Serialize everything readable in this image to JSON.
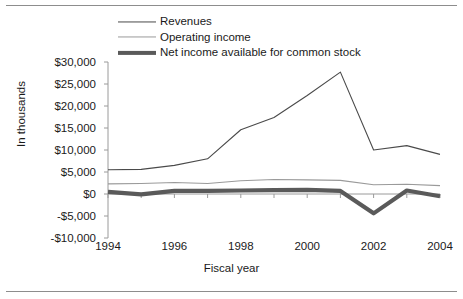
{
  "figure": {
    "border_color": "#8d8d8d",
    "background": "#ffffff"
  },
  "chart_data": {
    "type": "line",
    "title": "",
    "xlabel": "Fiscal year",
    "ylabel": "In thousands",
    "x": [
      1994,
      1995,
      1996,
      1997,
      1998,
      1999,
      2000,
      2001,
      2002,
      2003,
      2004
    ],
    "xlim": [
      1994,
      2004
    ],
    "ylim": [
      -10000,
      30000
    ],
    "xticks": [
      1994,
      1996,
      1998,
      2000,
      2002,
      2004
    ],
    "xtick_labels": [
      "1994",
      "1996",
      "1998",
      "2000",
      "2002",
      "2004"
    ],
    "yticks": [
      -10000,
      -5000,
      0,
      5000,
      10000,
      15000,
      20000,
      25000,
      30000
    ],
    "ytick_labels": [
      "-$10,000",
      "-$5,000",
      "$0",
      "$5,000",
      "$10,000",
      "$15,000",
      "$20,000",
      "$25,000",
      "$30,000"
    ],
    "grid": false,
    "legend_position": "top-center",
    "series": [
      {
        "name": "Revenues",
        "color": "#4a4a4a",
        "width": 1.1,
        "values": [
          5500,
          5600,
          6500,
          8000,
          14600,
          17400,
          22400,
          27700,
          10000,
          11000,
          9000
        ]
      },
      {
        "name": "Operating income",
        "color": "#9a9a9a",
        "width": 1.1,
        "values": [
          2300,
          2400,
          2600,
          2400,
          3000,
          3300,
          3200,
          3100,
          2100,
          2200,
          1900
        ]
      },
      {
        "name": "Net income available for common stock",
        "color": "#5a5a5a",
        "width": 4.2,
        "values": [
          500,
          -100,
          700,
          700,
          800,
          900,
          950,
          700,
          -4400,
          800,
          -500
        ]
      }
    ]
  },
  "axis_labels": {
    "x_title": "Fiscal year",
    "y_title": "In thousands"
  }
}
